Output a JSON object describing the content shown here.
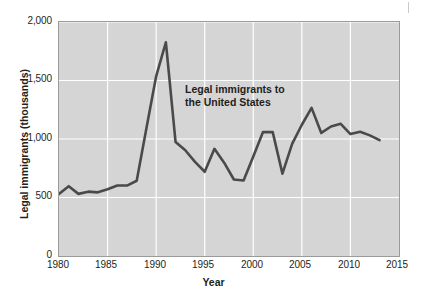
{
  "chart_data": {
    "type": "line",
    "title": "",
    "annotation": "Legal immigrants to\nthe United States",
    "xlabel": "Year",
    "ylabel": "Legal immigrants (thousands)",
    "xlim": [
      1980,
      2015
    ],
    "ylim": [
      0,
      2000
    ],
    "xticks": [
      "1980",
      "1985",
      "1990",
      "1995",
      "2000",
      "2005",
      "2010",
      "2015"
    ],
    "xtick_values": [
      1980,
      1985,
      1990,
      1995,
      2000,
      2005,
      2010,
      2015
    ],
    "yticks": [
      "0",
      "500",
      "1,000",
      "1,500",
      "2,000"
    ],
    "ytick_values": [
      0,
      500,
      1000,
      1500,
      2000
    ],
    "grid": true,
    "grid_color": "#ffffff",
    "plot_background": "#d5d5d5",
    "line_color": "#4a4a4a",
    "line_width": 2.6,
    "legend": "none",
    "series": [
      {
        "name": "Legal immigrants to the United States",
        "x": [
          1980,
          1981,
          1982,
          1983,
          1984,
          1985,
          1986,
          1987,
          1988,
          1989,
          1990,
          1991,
          1992,
          1993,
          1994,
          1995,
          1996,
          1997,
          1998,
          1999,
          2000,
          2001,
          2002,
          2003,
          2004,
          2005,
          2006,
          2007,
          2008,
          2009,
          2010,
          2011,
          2012,
          2013
        ],
        "values": [
          531,
          597,
          531,
          550,
          544,
          570,
          602,
          602,
          643,
          1091,
          1536,
          1827,
          974,
          904,
          804,
          720,
          916,
          798,
          654,
          645,
          850,
          1059,
          1059,
          704,
          958,
          1122,
          1266,
          1052,
          1107,
          1130,
          1042,
          1062,
          1031,
          990
        ]
      }
    ]
  }
}
